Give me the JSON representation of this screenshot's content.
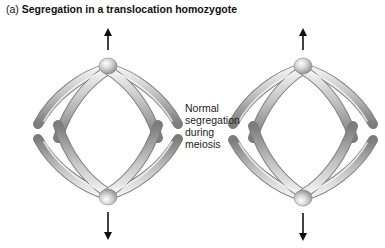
{
  "title": {
    "label": "(a)",
    "text": "Segregation in a translocation homozygote"
  },
  "caption": {
    "lines": [
      "Normal",
      "segregation",
      "during",
      "meiosis"
    ]
  },
  "figures": [
    {
      "name": "left-cell",
      "arrows": [
        "up",
        "down"
      ]
    },
    {
      "name": "right-cell",
      "arrows": [
        "up",
        "down"
      ]
    }
  ],
  "colors": {
    "chromosome": "#b8b8b8",
    "chromosome_dark": "#7a7a7a",
    "chromosome_light": "#f2f2f2",
    "arrow": "#111111",
    "text": "#111111"
  }
}
